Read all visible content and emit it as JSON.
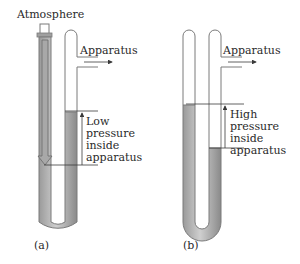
{
  "diagram": {
    "colors": {
      "tube_outline": "#7a7a7a",
      "liquid": "#b4b4b4",
      "liquid_dark": "#8e8e8e",
      "line": "#3a3a3a",
      "text": "#2a2a2a"
    },
    "panel_a": {
      "caption": "(a)",
      "top_label": "Atmosphere",
      "side_label": "Apparatus",
      "pressure_lines": [
        "Low",
        "pressure",
        "inside",
        "apparatus"
      ]
    },
    "panel_b": {
      "caption": "(b)",
      "side_label": "Apparatus",
      "pressure_lines": [
        "High",
        "pressure",
        "inside",
        "apparatus"
      ]
    }
  }
}
